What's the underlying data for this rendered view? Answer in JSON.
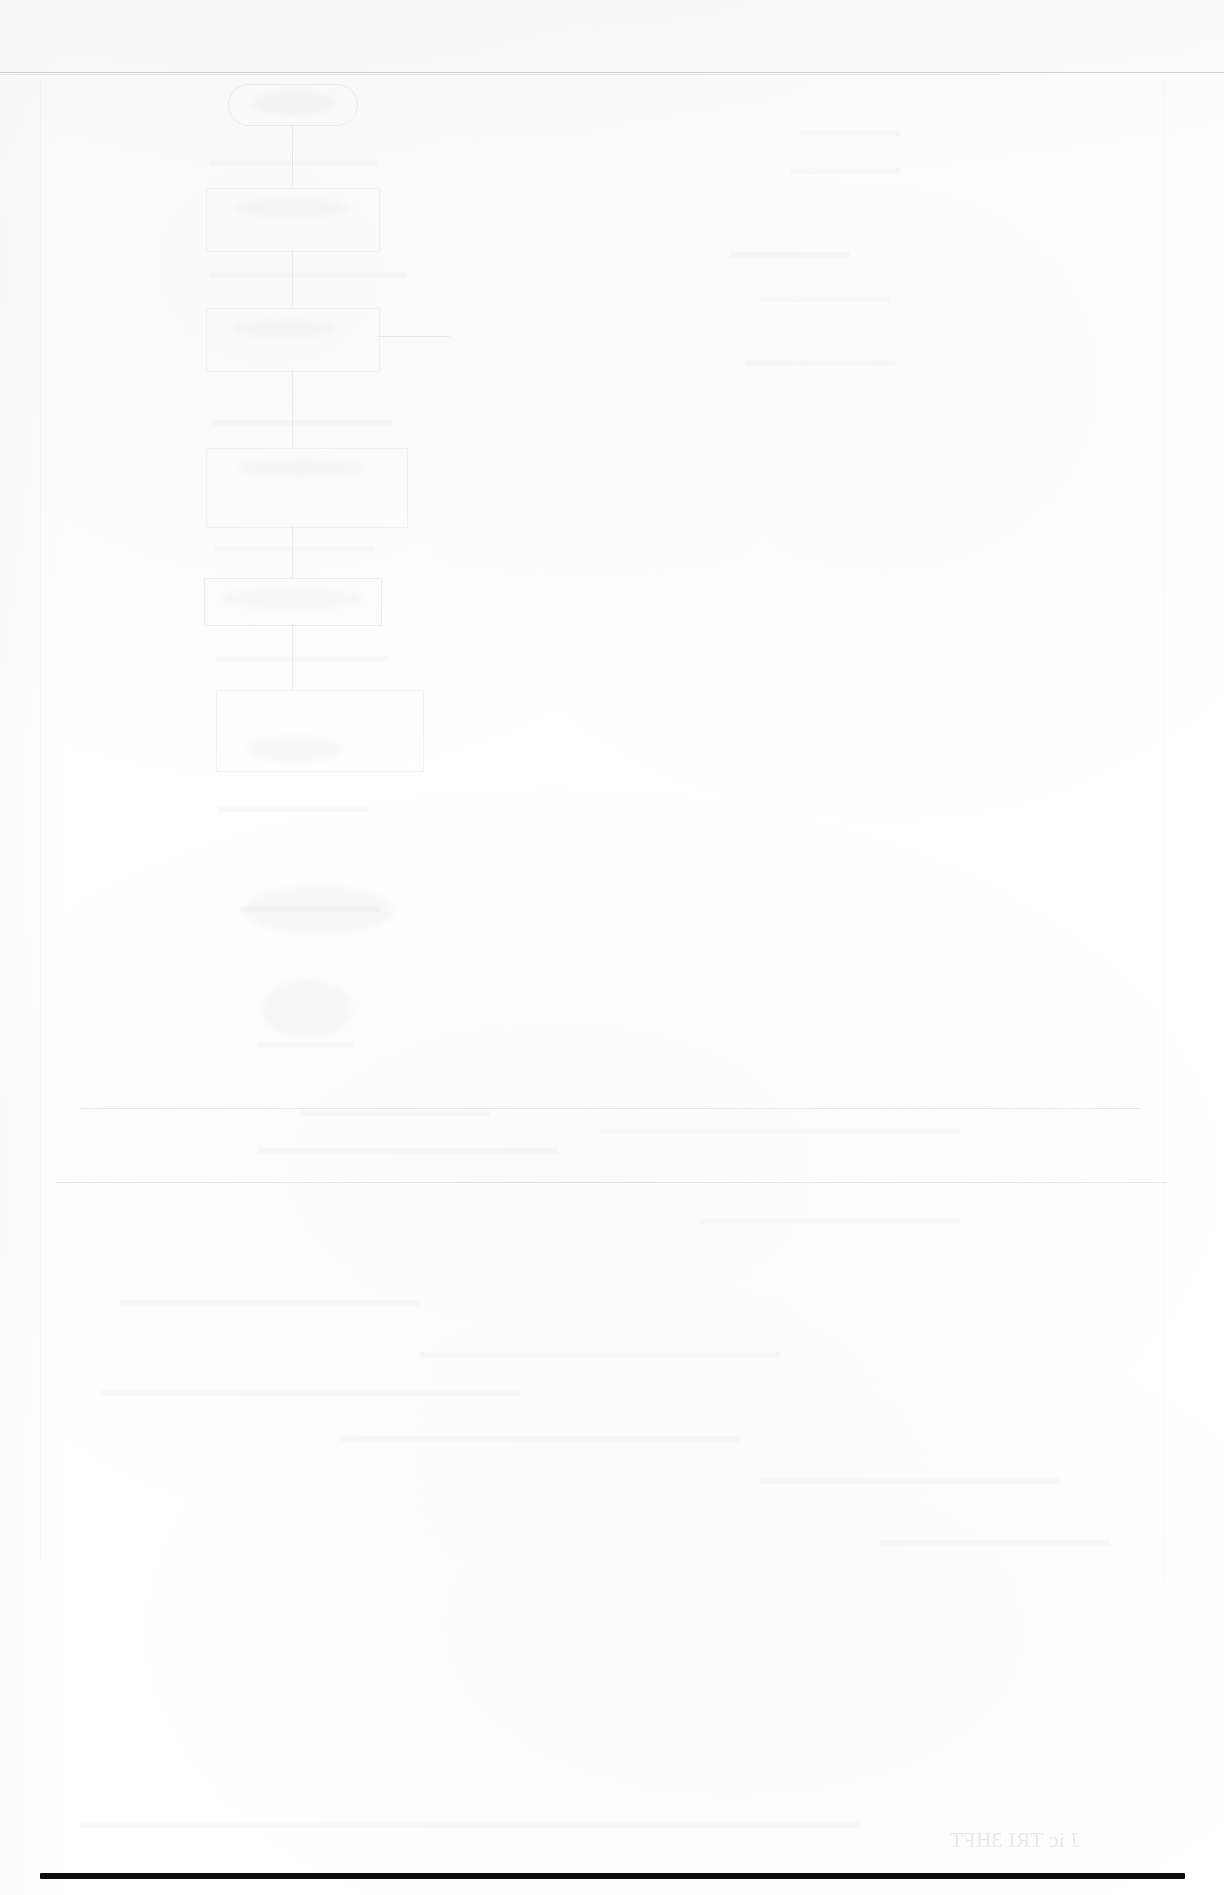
{
  "page": {
    "kind": "scanned-document-page",
    "condition": "severely-faded",
    "legible_text": "",
    "note": ""
  },
  "rules": {
    "top_rule": {
      "label": "",
      "x": 0,
      "y": 72,
      "width": 1224,
      "thickness": 1
    },
    "bottom_rule": {
      "label": "",
      "x": 40,
      "y": 1873,
      "width": 1145,
      "thickness": 6,
      "color": "#0d0d0d"
    }
  },
  "diagram": {
    "label": "",
    "nodes": [
      {
        "id": "n1",
        "shape": "rounded-rect",
        "label": "",
        "x": 228,
        "y": 84,
        "width": 128,
        "height": 40
      },
      {
        "id": "n2",
        "shape": "rect",
        "label": "",
        "x": 206,
        "y": 188,
        "width": 172,
        "height": 62
      },
      {
        "id": "n3",
        "shape": "rect",
        "label": "",
        "x": 206,
        "y": 308,
        "width": 172,
        "height": 62
      },
      {
        "id": "n4",
        "shape": "rect",
        "label": "",
        "x": 206,
        "y": 448,
        "width": 200,
        "height": 78
      },
      {
        "id": "n5",
        "shape": "rect",
        "label": "",
        "x": 204,
        "y": 578,
        "width": 176,
        "height": 46
      },
      {
        "id": "n6",
        "shape": "rect",
        "label": "",
        "x": 216,
        "y": 690,
        "width": 206,
        "height": 80
      }
    ],
    "connectors": [
      {
        "from": "n1",
        "to": "n2",
        "label": ""
      },
      {
        "from": "n2",
        "to": "n3",
        "label": ""
      },
      {
        "from": "n3",
        "to": "n4",
        "label": ""
      },
      {
        "from": "n4",
        "to": "n5",
        "label": ""
      },
      {
        "from": "n5",
        "to": "n6",
        "label": ""
      },
      {
        "from": "n3",
        "to": "branch",
        "label": ""
      }
    ]
  },
  "bleed_through": {
    "bottom_right": {
      "text": "J ic TRI 3HFT",
      "mirrored": true
    }
  },
  "colors": {
    "paper": "#fefefe",
    "hard_ink": "#0d0d0d",
    "ghost_ink": "rgba(128,128,134,0.13)"
  }
}
